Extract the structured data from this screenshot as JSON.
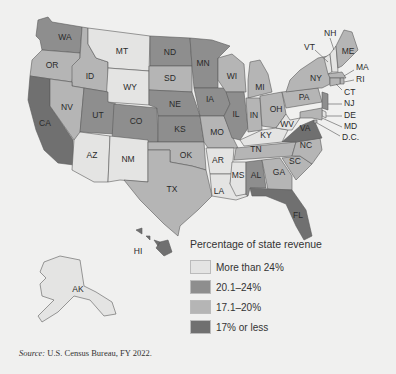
{
  "legend": {
    "title": "Percentage of state revenue",
    "categories": [
      {
        "key": "gt24",
        "label": "More than 24%",
        "color": "#e4e4e3"
      },
      {
        "key": "20to24",
        "label": "20.1–24%",
        "color": "#8e8e8e"
      },
      {
        "key": "17to20",
        "label": "17.1–20%",
        "color": "#b5b5b5"
      },
      {
        "key": "le17",
        "label": "17% or less",
        "color": "#707070"
      }
    ]
  },
  "source": {
    "prefix": "Source:",
    "text": " U.S. Census Bureau, FY 2022."
  },
  "chart_data": {
    "type": "choropleth",
    "title": "Percentage of state revenue",
    "legend_position": "bottom-right",
    "states": [
      {
        "abbr": "WA",
        "category": "20to24"
      },
      {
        "abbr": "OR",
        "category": "17to20"
      },
      {
        "abbr": "CA",
        "category": "le17"
      },
      {
        "abbr": "ID",
        "category": "17to20"
      },
      {
        "abbr": "NV",
        "category": "17to20"
      },
      {
        "abbr": "MT",
        "category": "gt24"
      },
      {
        "abbr": "WY",
        "category": "gt24"
      },
      {
        "abbr": "UT",
        "category": "20to24"
      },
      {
        "abbr": "CO",
        "category": "20to24"
      },
      {
        "abbr": "AZ",
        "category": "gt24"
      },
      {
        "abbr": "NM",
        "category": "gt24"
      },
      {
        "abbr": "ND",
        "category": "20to24"
      },
      {
        "abbr": "SD",
        "category": "17to20"
      },
      {
        "abbr": "NE",
        "category": "20to24"
      },
      {
        "abbr": "KS",
        "category": "20to24"
      },
      {
        "abbr": "OK",
        "category": "17to20"
      },
      {
        "abbr": "TX",
        "category": "17to20"
      },
      {
        "abbr": "MN",
        "category": "20to24"
      },
      {
        "abbr": "IA",
        "category": "20to24"
      },
      {
        "abbr": "MO",
        "category": "17to20"
      },
      {
        "abbr": "AR",
        "category": "gt24"
      },
      {
        "abbr": "LA",
        "category": "gt24"
      },
      {
        "abbr": "WI",
        "category": "17to20"
      },
      {
        "abbr": "IL",
        "category": "20to24"
      },
      {
        "abbr": "MS",
        "category": "gt24"
      },
      {
        "abbr": "MI",
        "category": "17to20"
      },
      {
        "abbr": "IN",
        "category": "17to20"
      },
      {
        "abbr": "OH",
        "category": "17to20"
      },
      {
        "abbr": "KY",
        "category": "gt24"
      },
      {
        "abbr": "TN",
        "category": "17to20"
      },
      {
        "abbr": "AL",
        "category": "20to24"
      },
      {
        "abbr": "GA",
        "category": "17to20"
      },
      {
        "abbr": "FL",
        "category": "le17"
      },
      {
        "abbr": "SC",
        "category": "17to20"
      },
      {
        "abbr": "NC",
        "category": "17to20"
      },
      {
        "abbr": "VA",
        "category": "le17"
      },
      {
        "abbr": "WV",
        "category": "gt24"
      },
      {
        "abbr": "PA",
        "category": "17to20"
      },
      {
        "abbr": "NY",
        "category": "17to20"
      },
      {
        "abbr": "VT",
        "category": "gt24"
      },
      {
        "abbr": "NH",
        "category": "gt24"
      },
      {
        "abbr": "ME",
        "category": "17to20"
      },
      {
        "abbr": "MA",
        "category": "17to20"
      },
      {
        "abbr": "RI",
        "category": "17to20"
      },
      {
        "abbr": "CT",
        "category": "17to20"
      },
      {
        "abbr": "NJ",
        "category": "20to24"
      },
      {
        "abbr": "DE",
        "category": "gt24"
      },
      {
        "abbr": "MD",
        "category": "17to20"
      },
      {
        "abbr": "D.C.",
        "category": "17to20"
      },
      {
        "abbr": "AK",
        "category": "gt24"
      },
      {
        "abbr": "HI",
        "category": "le17"
      }
    ]
  }
}
